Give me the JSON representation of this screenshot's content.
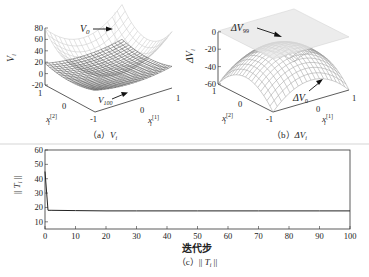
{
  "chart_data": [
    {
      "id": "a",
      "type": "surface3d",
      "caption": "（a）V_i",
      "caption_prefix": "（a）",
      "caption_var": "V",
      "caption_sub": "i",
      "zlabel": "V_i",
      "zlabel_var": "V",
      "zlabel_sub": "i",
      "xlabel": "x_i^[1]",
      "ylabel": "x_i^[2]",
      "x_range": [
        -1,
        1
      ],
      "y_range": [
        -1,
        1
      ],
      "zlim": [
        -20,
        80
      ],
      "zticks": [
        "80",
        "60",
        "40",
        "20",
        "0",
        "-20"
      ],
      "xticks": [
        "0",
        "1"
      ],
      "yticks": [
        "1",
        "0",
        "-1"
      ],
      "surfaces": [
        {
          "name": "V_0",
          "label_var": "V",
          "label_sub": "0",
          "shape": "convex bowl",
          "z_range_approx": [
            0,
            80
          ]
        },
        {
          "name": "V_100",
          "label_var": "V",
          "label_sub": "100",
          "shape": "shallow convex bowl",
          "z_range_approx": [
            0,
            20
          ]
        }
      ]
    },
    {
      "id": "b",
      "type": "surface3d",
      "caption": "（b）ΔV_i",
      "caption_prefix": "（b）",
      "caption_var": "ΔV",
      "caption_sub": "i",
      "zlabel": "ΔV_i",
      "zlabel_var": "ΔV",
      "zlabel_sub": "i",
      "xlabel": "x_i^[1]",
      "ylabel": "x_i^[2]",
      "x_range": [
        -1,
        1
      ],
      "y_range": [
        -1,
        1
      ],
      "zlim": [
        -60,
        0
      ],
      "zticks": [
        "0",
        "-20",
        "-40",
        "-60"
      ],
      "xticks": [
        "0",
        "1"
      ],
      "yticks": [
        "1",
        "0",
        "-1"
      ],
      "surfaces": [
        {
          "name": "ΔV_99",
          "label_var": "ΔV",
          "label_sub": "99",
          "shape": "near-flat plane",
          "z_approx": 0
        },
        {
          "name": "ΔV_0",
          "label_var": "ΔV",
          "label_sub": "0",
          "shape": "concave dome",
          "z_range_approx": [
            -60,
            -10
          ]
        }
      ]
    },
    {
      "id": "c",
      "type": "line",
      "caption": "（c）|| T_i ||",
      "caption_prefix": "（c）",
      "caption_var": "T",
      "caption_sub": "i",
      "xlabel": "迭代步",
      "ylabel": "|| T_i ||",
      "ylabel_var": "T",
      "ylabel_sub": "i",
      "xlim": [
        0,
        100
      ],
      "ylim": [
        5,
        60
      ],
      "xticks": [
        0,
        10,
        20,
        30,
        40,
        50,
        60,
        70,
        80,
        90,
        100
      ],
      "yticks": [
        10,
        20,
        30,
        40,
        50,
        60
      ],
      "grid": false,
      "series": [
        {
          "name": "||T_i||",
          "x": [
            0,
            1,
            2,
            10,
            20,
            30,
            40,
            50,
            60,
            70,
            80,
            90,
            100
          ],
          "values": [
            45,
            18,
            18,
            17.8,
            17.6,
            17.6,
            17.6,
            17.6,
            17.6,
            17.6,
            17.6,
            17.6,
            17.6
          ]
        }
      ]
    }
  ]
}
